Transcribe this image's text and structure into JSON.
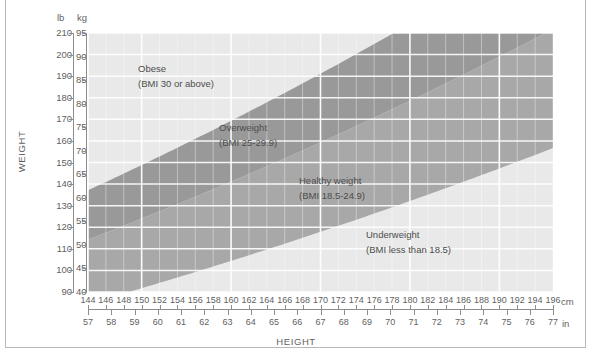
{
  "figure": {
    "x_axis_label": "HEIGHT",
    "y_axis_label": "WEIGHT",
    "unit_captions": {
      "lb": "lb",
      "kg": "kg",
      "cm": "cm",
      "in": "in"
    }
  },
  "chart_data": {
    "type": "area",
    "title": "",
    "xlabel": "HEIGHT",
    "ylabel": "WEIGHT",
    "grid": true,
    "legend_position": "in-plot annotations",
    "x_primary_unit": "cm",
    "x_secondary_unit": "in",
    "y_primary_unit": "lb",
    "y_secondary_unit": "kg",
    "xlim_cm": [
      144,
      196
    ],
    "xlim_in": [
      57,
      77
    ],
    "ylim_lb": [
      90,
      210
    ],
    "ylim_kg": [
      40,
      95
    ],
    "x_ticks_cm": [
      144,
      146,
      148,
      150,
      152,
      154,
      156,
      158,
      160,
      162,
      164,
      166,
      168,
      170,
      172,
      174,
      176,
      178,
      180,
      182,
      184,
      186,
      188,
      190,
      192,
      194,
      196
    ],
    "x_ticks_in": [
      57,
      58,
      59,
      60,
      61,
      62,
      63,
      64,
      65,
      66,
      67,
      68,
      69,
      70,
      71,
      72,
      73,
      74,
      75,
      76,
      77
    ],
    "y_ticks_lb": [
      210,
      200,
      190,
      180,
      170,
      160,
      150,
      140,
      130,
      120,
      110,
      100,
      90
    ],
    "y_ticks_kg": [
      95,
      90,
      85,
      80,
      75,
      70,
      65,
      60,
      55,
      50,
      45,
      40
    ],
    "bands": [
      {
        "name": "Obese",
        "bmi_label": "(BMI 30 or above)",
        "bmi_min": 30,
        "bmi_max": null,
        "fill": "#e9e9e9"
      },
      {
        "name": "Overweight",
        "bmi_label": "(BMI 25-29.9)",
        "bmi_min": 25,
        "bmi_max": 29.9,
        "fill": "#999999"
      },
      {
        "name": "Healthy weight",
        "bmi_label": "(BMI 18.5-24.9)",
        "bmi_min": 18.5,
        "bmi_max": 24.9,
        "fill": "#a8a8a8"
      },
      {
        "name": "Underweight",
        "bmi_label": "(BMI less than 18.5)",
        "bmi_min": null,
        "bmi_max": 18.5,
        "fill": "#e9e9e9"
      }
    ],
    "boundary_isolines_bmi": [
      30,
      25,
      18.5
    ]
  },
  "zones": {
    "obese": {
      "name": "Obese",
      "bmi": "(BMI 30 or above)"
    },
    "overweight": {
      "name": "Overweight",
      "bmi": "(BMI 25-29.9)"
    },
    "healthy": {
      "name": "Healthy weight",
      "bmi": "(BMI 18.5-24.9)"
    },
    "underweight": {
      "name": "Underweight",
      "bmi": "(BMI less than 18.5)"
    }
  },
  "colors": {
    "plot_background": "#e9e9e9",
    "band_overweight": "#999999",
    "band_healthy": "#a8a8a8",
    "gridline": "#ffffff",
    "axis": "#8d8d8d",
    "text": "#5f5f5f",
    "frame": "#b9b9b9"
  }
}
